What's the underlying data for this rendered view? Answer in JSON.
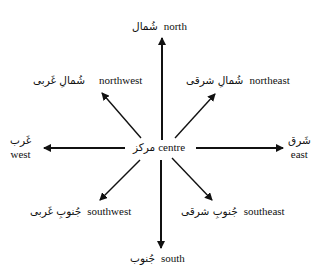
{
  "diagram": {
    "type": "compass-directions",
    "center": {
      "arabic": "مرکز",
      "english": "centre"
    },
    "directions": [
      {
        "key": "north",
        "arabic": "شُمال",
        "english": "north"
      },
      {
        "key": "northeast",
        "arabic": "شُمالِ شرقی",
        "english": "northeast"
      },
      {
        "key": "east",
        "arabic": "شَرق",
        "english": "east"
      },
      {
        "key": "southeast",
        "arabic": "جُنوبِ شرقی",
        "english": "southeast"
      },
      {
        "key": "south",
        "arabic": "جُنوب",
        "english": "south"
      },
      {
        "key": "southwest",
        "arabic": "جُنوبِ غَربی",
        "english": "southwest"
      },
      {
        "key": "west",
        "arabic": "غَرب",
        "english": "west"
      },
      {
        "key": "northwest",
        "arabic": "شُمالِ غَربی",
        "english": "northwest"
      }
    ],
    "arrow_color": "#111111"
  }
}
